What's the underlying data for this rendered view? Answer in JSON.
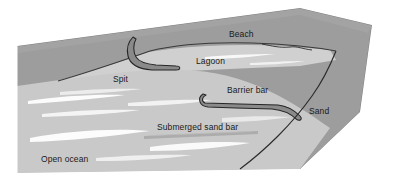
{
  "figure": {
    "type": "illustration",
    "width": 410,
    "height": 181
  },
  "labels": {
    "beach": "Beach",
    "lagoon": "Lagoon",
    "spit": "Spit",
    "barrier_bar": "Barrier bar",
    "sand": "Sand",
    "submerged_sand_bar": "Submerged sand bar",
    "open_ocean": "Open ocean"
  },
  "colors": {
    "background": "#ffffff",
    "land": "#9d9d9d",
    "land_dark": "#8e8e8e",
    "lagoon": "#d0d0d0",
    "ocean": "#c9c9c9",
    "ocean_light": "#d6d6d6",
    "spit_fill": "#8a8a8a",
    "outline": "#2b2b2b",
    "wave_streak": "#ffffff",
    "label_text": "#1a1a1a"
  },
  "regions": [
    {
      "name": "land",
      "label": "Beach",
      "shade": "dark-gray"
    },
    {
      "name": "lagoon",
      "label": "Lagoon",
      "shade": "light-gray"
    },
    {
      "name": "ocean",
      "label": "Open ocean",
      "shade": "mid-gray"
    },
    {
      "name": "spit",
      "label": "Spit",
      "shade": "dark-outline-hook"
    },
    {
      "name": "barrier-bar",
      "label": "Barrier bar",
      "shade": "dark-outline-hook"
    },
    {
      "name": "submerged-bar",
      "label": "Submerged sand bar",
      "shade": "mid-gray-bar"
    },
    {
      "name": "sand",
      "label": "Sand",
      "shade": "dark-gray"
    }
  ]
}
